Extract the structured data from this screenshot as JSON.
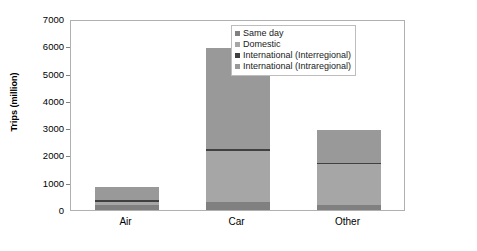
{
  "chart_data": {
    "type": "bar",
    "subtype": "stacked-vertical",
    "title": "",
    "xlabel": "",
    "ylabel": "Trips (million)",
    "categories": [
      "Air",
      "Car",
      "Other"
    ],
    "ylim": [
      0,
      7000
    ],
    "ytick_values": [
      0,
      1000,
      2000,
      3000,
      4000,
      5000,
      6000,
      7000
    ],
    "ytick_labels": [
      "0",
      "1000",
      "2000",
      "3000",
      "4000",
      "5000",
      "6000",
      "7000"
    ],
    "grid": false,
    "legend_position": "top-right-inside",
    "series": [
      {
        "name": "Same day",
        "color": "#808080",
        "values": [
          200,
          300,
          180
        ]
      },
      {
        "name": "Domestic",
        "color": "#a6a6a6",
        "values": [
          80,
          1900,
          1520
        ]
      },
      {
        "name": "International (Interregional)",
        "color": "#404040",
        "values": [
          100,
          60,
          60
        ]
      },
      {
        "name": "International (Intraregional)",
        "color": "#999999",
        "values": [
          470,
          3740,
          1190
        ]
      }
    ],
    "totals": [
      850,
      6000,
      2950
    ]
  },
  "legend": {
    "items": [
      {
        "label": "Same day",
        "color": "#808080"
      },
      {
        "label": "Domestic",
        "color": "#a6a6a6"
      },
      {
        "label": "International (Interregional)",
        "color": "#404040"
      },
      {
        "label": "International (Intraregional)",
        "color": "#999999"
      }
    ]
  },
  "colors": {
    "plot_border": "#b0b0b0",
    "background": "#ffffff",
    "text": "#000000"
  }
}
